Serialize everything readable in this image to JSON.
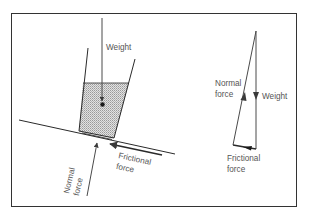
{
  "diagram": {
    "type": "force-diagram",
    "colors": {
      "line": "#2a2a2a",
      "arrow": "#4a4a4a",
      "text": "#555555",
      "fill_hatch": "#c8c8c8",
      "background": "#ffffff"
    },
    "left_panel": {
      "description": "Beaker of liquid resting on an inclined surface",
      "labels": {
        "weight": "Weight",
        "frictional_line1": "Frictional",
        "frictional_line2": "force",
        "normal_line1": "Normal",
        "normal_line2": "force"
      }
    },
    "right_panel": {
      "description": "Triangle of forces",
      "labels": {
        "normal_line1": "Normal",
        "normal_line2": "force",
        "weight": "Weight",
        "frictional_line1": "Frictional",
        "frictional_line2": "force"
      }
    }
  }
}
